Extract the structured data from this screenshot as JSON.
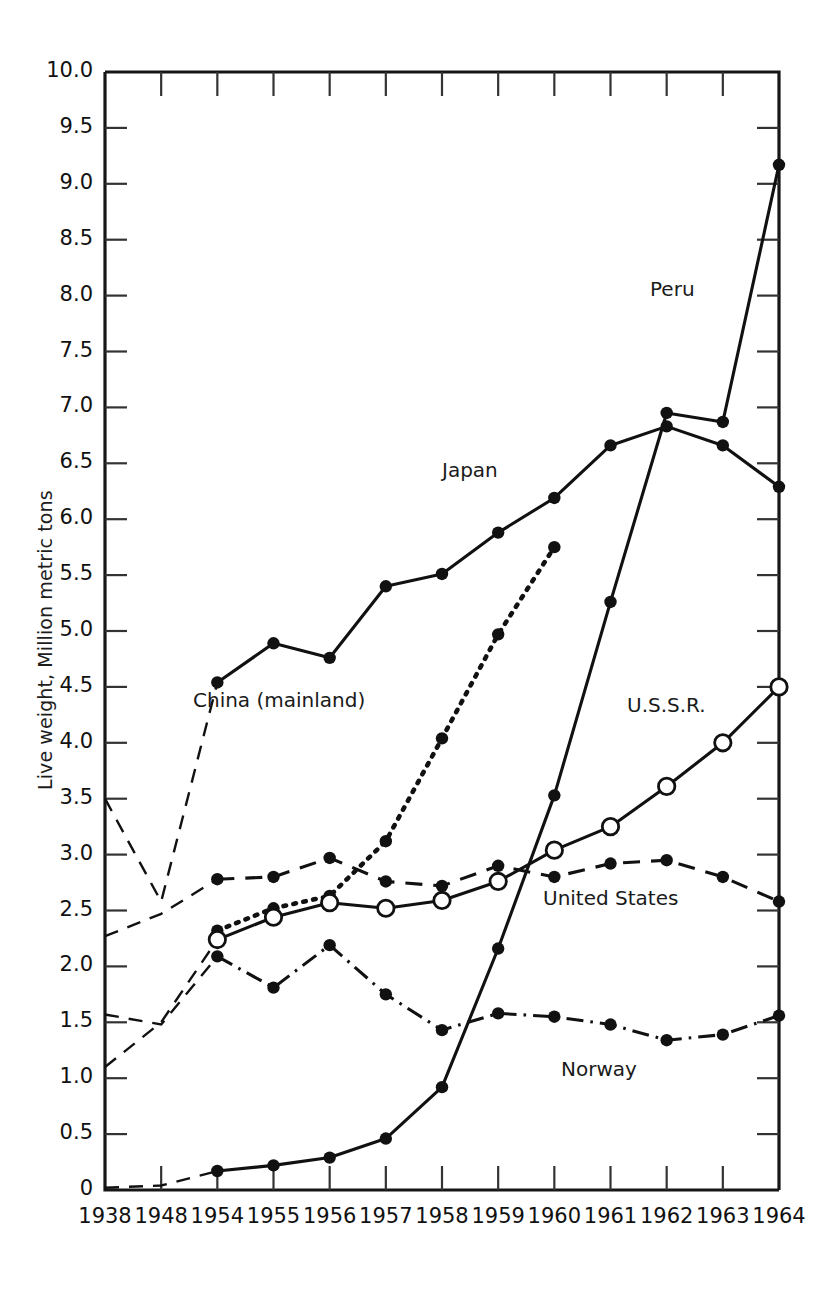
{
  "chart_data": {
    "type": "line",
    "title": "",
    "xlabel": "",
    "ylabel": "Live weight, Million metric tons",
    "categories": [
      "1938",
      "1948",
      "1954",
      "1955",
      "1956",
      "1957",
      "1958",
      "1959",
      "1960",
      "1961",
      "1962",
      "1963",
      "1964"
    ],
    "xtick_labels": [
      "1938",
      "1948",
      "1954",
      "1955",
      "1956",
      "1957",
      "1958",
      "1959",
      "1960",
      "1961",
      "1962",
      "1963",
      "1964"
    ],
    "ytick_labels": [
      "0",
      "0.5",
      "1.0",
      "1.5",
      "2.0",
      "2.5",
      "3.0",
      "3.5",
      "4.0",
      "4.5",
      "5.0",
      "5.5",
      "6.0",
      "6.5",
      "7.0",
      "7.5",
      "8.0",
      "8.5",
      "9.0",
      "9.5",
      "10.0"
    ],
    "ytick_values": [
      0,
      0.5,
      1.0,
      1.5,
      2.0,
      2.5,
      3.0,
      3.5,
      4.0,
      4.5,
      5.0,
      5.5,
      6.0,
      6.5,
      7.0,
      7.5,
      8.0,
      8.5,
      9.0,
      9.5,
      10.0
    ],
    "ylim": [
      0,
      10.0
    ],
    "grid": false,
    "legend": "inline-labels",
    "series": [
      {
        "name": "Peru",
        "label": "Peru",
        "line_style": "solid",
        "marker": "filled-circle",
        "color": "#111111",
        "label_x": 1962.1,
        "label_y": 8.05,
        "values": [
          0.02,
          0.04,
          0.17,
          0.22,
          0.29,
          0.46,
          0.92,
          2.16,
          3.53,
          5.26,
          6.95,
          6.87,
          9.17
        ],
        "dashed_leadin_points": 2
      },
      {
        "name": "Japan",
        "label": "Japan",
        "line_style": "solid",
        "marker": "filled-circle",
        "color": "#111111",
        "label_x": 1958.5,
        "label_y": 6.43,
        "values": [
          3.5,
          2.58,
          4.54,
          4.89,
          4.76,
          5.4,
          5.51,
          5.88,
          6.19,
          6.66,
          6.83,
          6.66,
          6.29
        ],
        "dashed_leadin_points": 2
      },
      {
        "name": "China (mainland)",
        "label": "China (mainland)",
        "line_style": "dotted",
        "marker": "filled-circle",
        "color": "#111111",
        "label_x": 1955.1,
        "label_y": 4.37,
        "values": [
          null,
          null,
          2.32,
          2.52,
          2.63,
          3.12,
          4.04,
          4.97,
          5.75,
          null,
          null,
          null,
          null
        ],
        "dashed_leadin_points": 0
      },
      {
        "name": "U.S.S.R.",
        "label": "U.S.S.R.",
        "line_style": "solid",
        "marker": "open-circle",
        "color": "#111111",
        "label_x": 1962.0,
        "label_y": 4.33,
        "values": [
          1.1,
          1.5,
          2.24,
          2.44,
          2.57,
          2.52,
          2.59,
          2.76,
          3.04,
          3.25,
          3.61,
          4.0,
          4.5
        ],
        "dashed_leadin_points": 2
      },
      {
        "name": "United States",
        "label": "United States",
        "line_style": "dashed",
        "marker": "filled-circle",
        "color": "#111111",
        "label_x": 1961.0,
        "label_y": 2.6,
        "values": [
          2.27,
          2.47,
          2.78,
          2.8,
          2.97,
          2.76,
          2.72,
          2.9,
          2.8,
          2.92,
          2.95,
          2.8,
          2.58
        ],
        "dashed_leadin_points": 2
      },
      {
        "name": "Norway",
        "label": "Norway",
        "line_style": "dashdot",
        "marker": "filled-circle",
        "color": "#111111",
        "label_x": 1960.8,
        "label_y": 1.07,
        "values": [
          1.57,
          1.48,
          2.09,
          1.81,
          2.19,
          1.75,
          1.43,
          1.58,
          1.55,
          1.48,
          1.34,
          1.39,
          1.56
        ],
        "dashed_leadin_points": 2
      }
    ]
  }
}
